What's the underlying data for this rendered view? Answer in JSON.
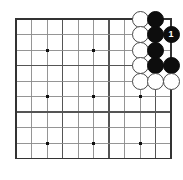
{
  "board": {
    "kind": "go-board-diagram",
    "label": "Go board corner problem diagram",
    "cols": 11,
    "rows": 10,
    "origin_x": 16,
    "origin_y": 19,
    "spacing": 15.5,
    "edge_color": "#333333",
    "line_color": "#8a8a8a",
    "heavy_line_color": "#555555",
    "background_color": "#ffffff",
    "heavy_cols": [
      0,
      3,
      6,
      9
    ],
    "heavy_rows": [
      0,
      3,
      6,
      9
    ],
    "star_points": [
      {
        "col": 2,
        "row": 2
      },
      {
        "col": 5,
        "row": 2
      },
      {
        "col": 8,
        "row": 2
      },
      {
        "col": 2,
        "row": 5
      },
      {
        "col": 5,
        "row": 5
      },
      {
        "col": 8,
        "row": 5
      },
      {
        "col": 2,
        "row": 8
      },
      {
        "col": 5,
        "row": 8
      },
      {
        "col": 8,
        "row": 8
      }
    ],
    "star_color": "#111111",
    "star_size": 3
  },
  "stones": [
    {
      "col": 8,
      "row": 0,
      "color": "white",
      "label": ""
    },
    {
      "col": 9,
      "row": 0,
      "color": "black",
      "label": ""
    },
    {
      "col": 8,
      "row": 1,
      "color": "white",
      "label": ""
    },
    {
      "col": 9,
      "row": 1,
      "color": "black",
      "label": ""
    },
    {
      "col": 10,
      "row": 1,
      "color": "black",
      "label": "1"
    },
    {
      "col": 8,
      "row": 2,
      "color": "white",
      "label": ""
    },
    {
      "col": 9,
      "row": 2,
      "color": "black",
      "label": ""
    },
    {
      "col": 8,
      "row": 3,
      "color": "white",
      "label": ""
    },
    {
      "col": 9,
      "row": 3,
      "color": "black",
      "label": ""
    },
    {
      "col": 10,
      "row": 3,
      "color": "black",
      "label": ""
    },
    {
      "col": 8,
      "row": 4,
      "color": "white",
      "label": ""
    },
    {
      "col": 9,
      "row": 4,
      "color": "white",
      "label": ""
    },
    {
      "col": 10,
      "row": 4,
      "color": "white",
      "label": ""
    }
  ],
  "colors": {
    "black_stone": "#0d0d0d",
    "white_stone": "#ffffff",
    "white_stone_border": "#4a4a4a",
    "black_label_text": "#ffffff"
  }
}
